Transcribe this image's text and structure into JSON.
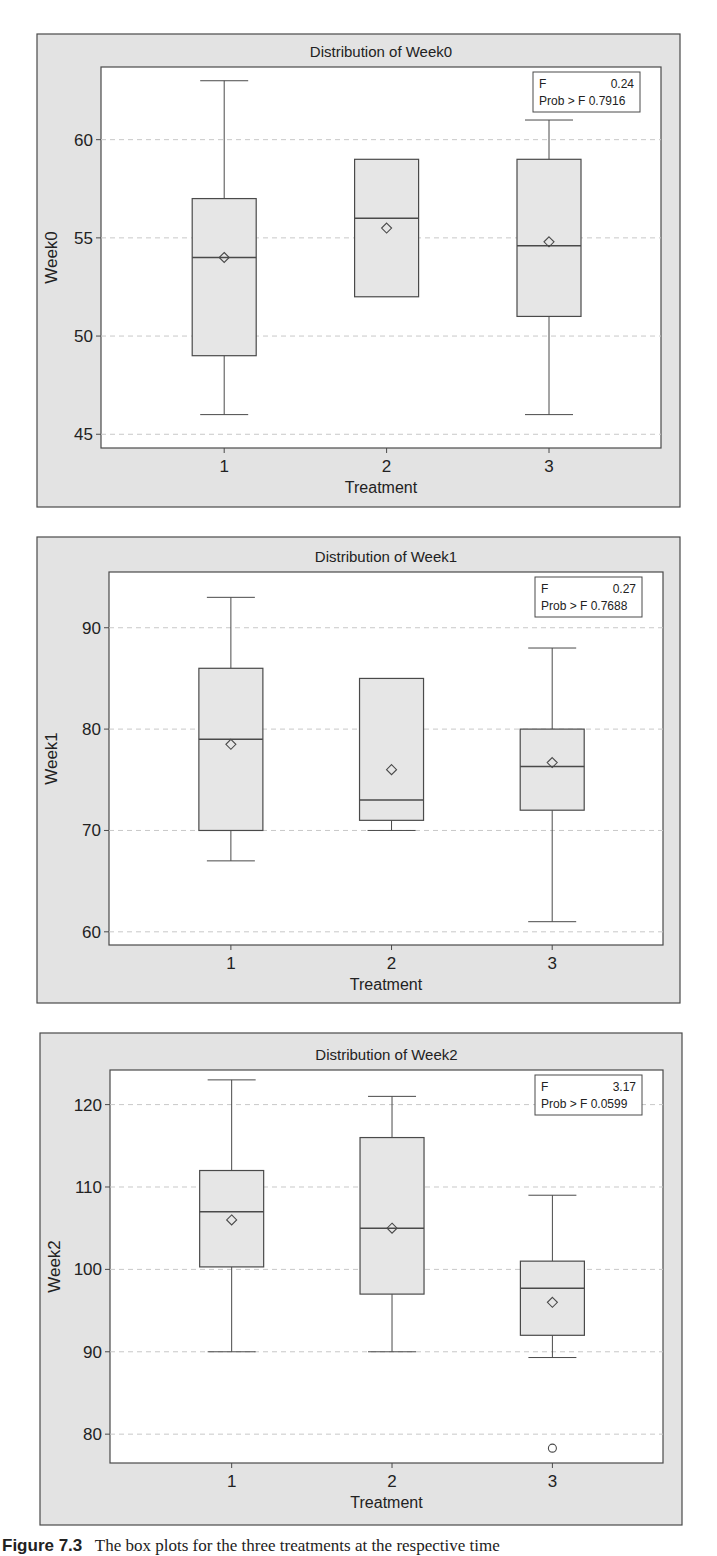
{
  "figure": {
    "caption_label": "Figure 7.3",
    "caption_text": "The box plots for the three treatments at the respective time"
  },
  "colors": {
    "frame_bg": "#e3e3e3",
    "plot_bg": "#ffffff",
    "box_fill": "#e6e6e6",
    "line": "#4a4a4a",
    "grid": "#c8c8c8",
    "text": "#222222"
  },
  "chart_data": [
    {
      "type": "box",
      "title": "Distribution of Week0",
      "xlabel": "Treatment",
      "ylabel": "Week0",
      "categories": [
        "1",
        "2",
        "3"
      ],
      "yticks": [
        45,
        50,
        55,
        60
      ],
      "ylim": [
        44.3,
        63.7
      ],
      "grid": true,
      "stats_box": {
        "f_label": "F",
        "f_value": "0.24",
        "p_label": "Prob > F",
        "p_value": "0.7916"
      },
      "boxes": [
        {
          "category": "1",
          "min": 46,
          "q1": 49,
          "median": 54,
          "mean": 54,
          "q3": 57,
          "max": 63,
          "outliers": []
        },
        {
          "category": "2",
          "min": 52,
          "q1": 52,
          "median": 56,
          "mean": 55.5,
          "q3": 59,
          "max": 59,
          "outliers": []
        },
        {
          "category": "3",
          "min": 46,
          "q1": 51,
          "median": 54.6,
          "mean": 54.8,
          "q3": 59,
          "max": 61,
          "outliers": []
        }
      ]
    },
    {
      "type": "box",
      "title": "Distribution of Week1",
      "xlabel": "Treatment",
      "ylabel": "Week1",
      "categories": [
        "1",
        "2",
        "3"
      ],
      "yticks": [
        60,
        70,
        80,
        90
      ],
      "ylim": [
        58.7,
        95.5
      ],
      "grid": true,
      "stats_box": {
        "f_label": "F",
        "f_value": "0.27",
        "p_label": "Prob > F",
        "p_value": "0.7688"
      },
      "boxes": [
        {
          "category": "1",
          "min": 67,
          "q1": 70,
          "median": 79,
          "mean": 78.5,
          "q3": 86,
          "max": 93,
          "outliers": []
        },
        {
          "category": "2",
          "min": 70,
          "q1": 71,
          "median": 73,
          "mean": 76,
          "q3": 85,
          "max": 85,
          "outliers": []
        },
        {
          "category": "3",
          "min": 61,
          "q1": 72,
          "median": 76.3,
          "mean": 76.7,
          "q3": 80,
          "max": 88,
          "outliers": []
        }
      ]
    },
    {
      "type": "box",
      "title": "Distribution of Week2",
      "xlabel": "Treatment",
      "ylabel": "Week2",
      "categories": [
        "1",
        "2",
        "3"
      ],
      "yticks": [
        80,
        90,
        100,
        110,
        120
      ],
      "ylim": [
        76.5,
        124.2
      ],
      "grid": true,
      "stats_box": {
        "f_label": "F",
        "f_value": "3.17",
        "p_label": "Prob > F",
        "p_value": "0.0599"
      },
      "boxes": [
        {
          "category": "1",
          "min": 90,
          "q1": 100.3,
          "median": 107,
          "mean": 106,
          "q3": 112,
          "max": 123,
          "outliers": []
        },
        {
          "category": "2",
          "min": 90,
          "q1": 97,
          "median": 105,
          "mean": 105,
          "q3": 116,
          "max": 121,
          "outliers": []
        },
        {
          "category": "3",
          "min": 89.3,
          "q1": 92,
          "median": 97.7,
          "mean": 96,
          "q3": 101,
          "max": 109,
          "outliers": [
            78.3
          ]
        }
      ]
    }
  ]
}
